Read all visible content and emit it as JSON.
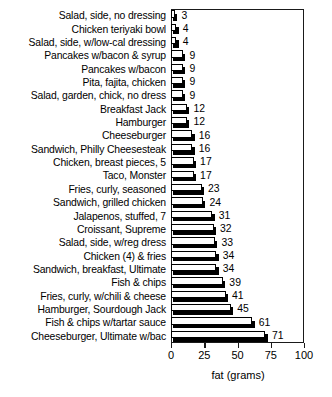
{
  "chart_data": {
    "type": "bar",
    "orientation": "horizontal",
    "title": "",
    "xlabel": "fat (grams)",
    "ylabel": "",
    "xlim": [
      0,
      100
    ],
    "xticks": [
      0,
      25,
      50,
      75,
      100
    ],
    "xtick_labels": [
      "0",
      "25",
      "50",
      "75",
      "100"
    ],
    "grid": false,
    "legend": null,
    "value_labels_shown": true,
    "categories": [
      "Salad, side, no dressing",
      "Chicken teriyaki bowl",
      "Salad, side, w/low-cal dressing",
      "Pancakes w/bacon & syrup",
      "Pancakes w/bacon",
      "Pita, fajita, chicken",
      "Salad, garden, chick, no dress",
      "Breakfast Jack",
      "Hamburger",
      "Cheeseburger",
      "Sandwich, Philly Cheesesteak",
      "Chicken, breast pieces, 5",
      "Taco, Monster",
      "Fries, curly, seasoned",
      "Sandwich, grilled chicken",
      "Jalapenos, stuffed, 7",
      "Croissant, Supreme",
      "Salad, side, w/reg dress",
      "Chicken (4) & fries",
      "Sandwich, breakfast, Ultimate",
      "Fish & chips",
      "Fries, curly, w/chili & cheese",
      "Hamburger, Sourdough Jack",
      "Fish & chips w/tartar sauce",
      "Cheeseburger, Ultimate w/bac"
    ],
    "values": [
      3,
      4,
      4,
      9,
      9,
      9,
      9,
      12,
      12,
      16,
      16,
      17,
      17,
      23,
      24,
      31,
      32,
      33,
      34,
      34,
      39,
      41,
      45,
      61,
      71
    ],
    "value_text": [
      "3",
      "4",
      "4",
      "9",
      "9",
      "9",
      "9",
      "12",
      "12",
      "16",
      "16",
      "17",
      "17",
      "23",
      "24",
      "31",
      "32",
      "33",
      "34",
      "34",
      "39",
      "41",
      "45",
      "61",
      "71"
    ],
    "colors": {
      "bar_face": "#ffffff",
      "bar_outline": "#000000",
      "bar_shadow": "#000000",
      "axis": "#1a1a1a",
      "text": "#000000",
      "background": "#ffffff"
    }
  }
}
